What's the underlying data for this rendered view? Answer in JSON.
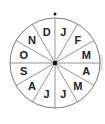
{
  "diagram": {
    "type": "month-wheel",
    "center": [
      55,
      63
    ],
    "radius": 45,
    "segments": 12,
    "labels": [
      "J",
      "F",
      "M",
      "A",
      "M",
      "J",
      "J",
      "A",
      "S",
      "O",
      "N",
      "D"
    ],
    "colors": {
      "line": "#555555",
      "text": "#222222",
      "fill": "#ffffff",
      "marker": "#111111"
    }
  }
}
